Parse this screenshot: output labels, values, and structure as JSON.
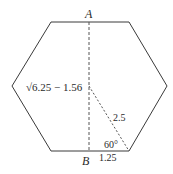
{
  "diagram": {
    "shape": "regular hexagon",
    "labels": {
      "top_point": "A",
      "bottom_point": "B",
      "height_expr": "√6.25 − 1.56",
      "side_length": "2.5",
      "half_side": "1.25",
      "angle": "60°"
    },
    "colors": {
      "stroke": "#3a3a3a",
      "dashed": "#555555",
      "text": "#2a2a2a",
      "background": "#ffffff"
    }
  }
}
